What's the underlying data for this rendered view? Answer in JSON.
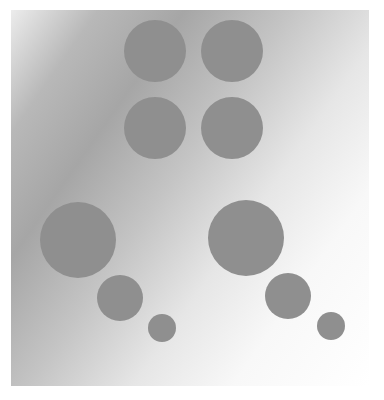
{
  "figure": {
    "background": {
      "gradient_from": "#a6a6a6",
      "gradient_to": "#ffffff",
      "direction": "upper-left dark to lower-right light"
    },
    "disc_color": "#8f8f8f",
    "discs": [
      {
        "id": "top-left",
        "cx": 155,
        "cy": 51,
        "r": 31
      },
      {
        "id": "top-right",
        "cx": 232,
        "cy": 51,
        "r": 31
      },
      {
        "id": "middle-left",
        "cx": 155,
        "cy": 128,
        "r": 31
      },
      {
        "id": "middle-right",
        "cx": 232,
        "cy": 128,
        "r": 31
      },
      {
        "id": "large-left",
        "cx": 78,
        "cy": 240,
        "r": 38
      },
      {
        "id": "large-right",
        "cx": 246,
        "cy": 238,
        "r": 38
      },
      {
        "id": "medium-left",
        "cx": 120,
        "cy": 298,
        "r": 23
      },
      {
        "id": "medium-right",
        "cx": 288,
        "cy": 296,
        "r": 23
      },
      {
        "id": "small-left",
        "cx": 162,
        "cy": 328,
        "r": 14
      },
      {
        "id": "small-right",
        "cx": 331,
        "cy": 326,
        "r": 14
      }
    ]
  }
}
